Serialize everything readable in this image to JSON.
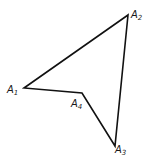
{
  "diagram": {
    "type": "quadrilateral",
    "stroke_color": "#111111",
    "background": "#ffffff",
    "vertices": [
      {
        "id": "A1",
        "letter": "A",
        "sub": "1",
        "x": 24,
        "y": 88,
        "label_x": 7,
        "label_y": 93
      },
      {
        "id": "A2",
        "letter": "A",
        "sub": "2",
        "x": 128,
        "y": 15,
        "label_x": 131,
        "label_y": 18
      },
      {
        "id": "A3",
        "letter": "A",
        "sub": "3",
        "x": 115,
        "y": 146,
        "label_x": 115,
        "label_y": 153
      },
      {
        "id": "A4",
        "letter": "A",
        "sub": "4",
        "x": 82,
        "y": 93,
        "label_x": 71,
        "label_y": 107
      }
    ],
    "edges": [
      [
        "A1",
        "A2"
      ],
      [
        "A2",
        "A3"
      ],
      [
        "A3",
        "A4"
      ],
      [
        "A4",
        "A1"
      ]
    ]
  }
}
